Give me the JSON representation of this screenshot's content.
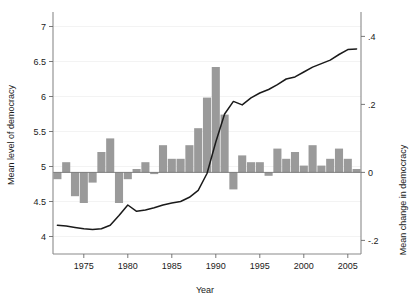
{
  "chart_data": {
    "type": "line",
    "title": "",
    "subtitle": "",
    "xlabel": "Year",
    "ylabel": "Mean level of democracy",
    "ylabel_right": "Mean change in democracy",
    "grid": true,
    "legend": null,
    "xlim": [
      1971.5,
      2006.5
    ],
    "ylim": [
      3.75,
      7.15
    ],
    "ylim_right": [
      -0.24,
      0.46
    ],
    "x_ticks": [
      1975,
      1980,
      1985,
      1990,
      1995,
      2000,
      2005
    ],
    "x_tick_labels": [
      "1975",
      "1980",
      "1985",
      "1990",
      "1995",
      "2000",
      "2005"
    ],
    "y_ticks": [
      4,
      4.5,
      5,
      5.5,
      6,
      6.5,
      7
    ],
    "y_tick_labels": [
      "4",
      "4.5",
      "5",
      "5.5",
      "6",
      "6.5",
      "7"
    ],
    "y_ticks_right": [
      -0.2,
      0,
      0.2,
      0.4
    ],
    "y_tick_labels_right": [
      "-.2",
      "0",
      ".2",
      ".4"
    ],
    "x": [
      1972,
      1973,
      1974,
      1975,
      1976,
      1977,
      1978,
      1979,
      1980,
      1981,
      1982,
      1983,
      1984,
      1985,
      1986,
      1987,
      1988,
      1989,
      1990,
      1991,
      1992,
      1993,
      1994,
      1995,
      1996,
      1997,
      1998,
      1999,
      2000,
      2001,
      2002,
      2003,
      2004,
      2005,
      2006
    ],
    "series": [
      {
        "name": "Mean level of democracy",
        "axis": "left",
        "type": "line",
        "values": [
          4.16,
          4.15,
          4.13,
          4.11,
          4.1,
          4.11,
          4.16,
          4.3,
          4.45,
          4.36,
          4.38,
          4.41,
          4.45,
          4.48,
          4.5,
          4.56,
          4.66,
          4.9,
          5.35,
          5.75,
          5.93,
          5.88,
          5.98,
          6.05,
          6.1,
          6.17,
          6.25,
          6.28,
          6.35,
          6.42,
          6.47,
          6.52,
          6.6,
          6.67,
          6.68
        ]
      },
      {
        "name": "Mean change in democracy",
        "axis": "right",
        "type": "bar",
        "values": [
          -0.02,
          0.03,
          -0.07,
          -0.09,
          -0.03,
          0.06,
          0.1,
          -0.09,
          -0.02,
          0.01,
          0.03,
          -0.005,
          0.08,
          0.04,
          0.04,
          0.08,
          0.13,
          0.22,
          0.31,
          0.17,
          -0.05,
          0.05,
          0.03,
          0.03,
          -0.01,
          0.07,
          0.04,
          0.06,
          0.02,
          0.08,
          0.02,
          0.04,
          0.07,
          0.04,
          0.01
        ]
      }
    ]
  },
  "axes": {
    "left_title": "Mean level of democracy",
    "right_title": "Mean change in democracy",
    "bottom_title": "Year"
  },
  "colors": {
    "line": "#1a1a1a",
    "bar": "#9a9a9a",
    "grid": "#f0f0f0",
    "spine": "#8a8a8a",
    "background": "#ffffff"
  }
}
